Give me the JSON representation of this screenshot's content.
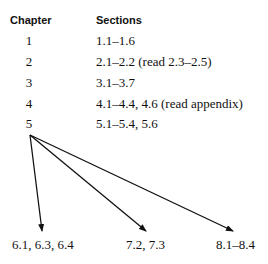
{
  "table": {
    "headers": {
      "chapter": "Chapter",
      "sections": "Sections"
    },
    "rows": [
      {
        "chapter": "1",
        "sections": "1.1–1.6"
      },
      {
        "chapter": "2",
        "sections": "2.1–2.2 (read 2.3–2.5)"
      },
      {
        "chapter": "3",
        "sections": "3.1–3.7"
      },
      {
        "chapter": "4",
        "sections": "4.1–4.4, 4.6 (read appendix)"
      },
      {
        "chapter": "5",
        "sections": "5.1–5.4, 5.6"
      }
    ]
  },
  "diagram": {
    "source": "5",
    "targets": [
      {
        "label": "6.1, 6.3, 6.4"
      },
      {
        "label": "7.2, 7.3"
      },
      {
        "label": "8.1–8.4"
      }
    ]
  }
}
